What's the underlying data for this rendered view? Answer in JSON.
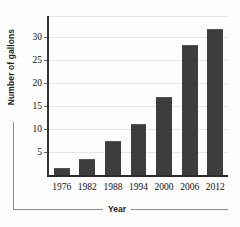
{
  "chart_data": {
    "type": "bar",
    "title": "",
    "xlabel": "Year",
    "ylabel": "Number of gallons",
    "categories": [
      "1976",
      "1982",
      "1988",
      "1994",
      "2000",
      "2006",
      "2012"
    ],
    "values": [
      1.3,
      3.2,
      7.2,
      10.8,
      16.7,
      28.0,
      31.4
    ],
    "series": [
      {
        "name": "Number of gallons",
        "values": [
          1.3,
          3.2,
          7.2,
          10.8,
          16.7,
          28.0,
          31.4
        ]
      }
    ],
    "ylim": [
      0,
      34.5
    ],
    "yticks": [
      5,
      10,
      15,
      20,
      25,
      30
    ],
    "ytick_labels": [
      "5",
      "10",
      "15",
      "20",
      "25",
      "30"
    ],
    "grid": true,
    "legend": false,
    "legend_position": "none",
    "bar_color": "#3d3d3d",
    "axis_color": "#333333",
    "gridline_color": "#e6e6e6",
    "background": "#fdfdfd"
  }
}
